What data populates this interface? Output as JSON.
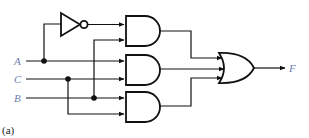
{
  "diagram": {
    "type": "logic-circuit",
    "inputs": [
      {
        "id": "A",
        "label": "A",
        "y": 61
      },
      {
        "id": "C",
        "label": "C",
        "y": 79
      },
      {
        "id": "B",
        "label": "B",
        "y": 98
      }
    ],
    "output": {
      "id": "F",
      "label": "F"
    },
    "gates": [
      {
        "id": "not1",
        "type": "NOT",
        "inputs": [
          "A"
        ]
      },
      {
        "id": "and1",
        "type": "AND",
        "inputs": [
          "not1",
          "B"
        ]
      },
      {
        "id": "and2",
        "type": "AND",
        "inputs": [
          "A",
          "C"
        ]
      },
      {
        "id": "and3",
        "type": "AND",
        "inputs": [
          "B",
          "C"
        ]
      },
      {
        "id": "or1",
        "type": "OR",
        "inputs": [
          "and1",
          "and2",
          "and3"
        ],
        "output": "F"
      }
    ],
    "caption": "(a)",
    "label_color": "#6f7fb0"
  }
}
